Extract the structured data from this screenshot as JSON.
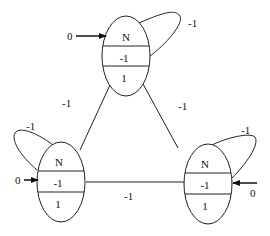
{
  "diagram": {
    "nodes": [
      {
        "id": "top",
        "title": "N",
        "mid": "-1",
        "bottom": "1",
        "input": "0",
        "self_loop": "-1"
      },
      {
        "id": "left",
        "title": "N",
        "mid": "-1",
        "bottom": "1",
        "input": "0",
        "self_loop": "-1"
      },
      {
        "id": "right",
        "title": "N",
        "mid": "-1",
        "bottom": "1",
        "input": "0",
        "self_loop": "-1"
      }
    ],
    "edges": [
      {
        "from": "top",
        "to": "left",
        "weight": "-1"
      },
      {
        "from": "top",
        "to": "right",
        "weight": "-1"
      },
      {
        "from": "left",
        "to": "right",
        "weight": "-1"
      }
    ]
  }
}
